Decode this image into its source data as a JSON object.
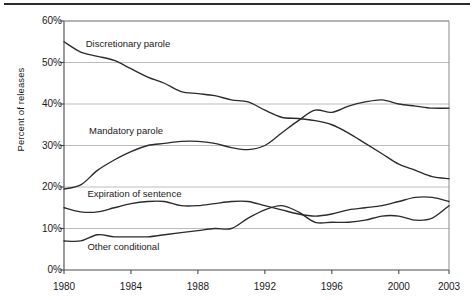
{
  "figure": {
    "has_top_rule": true,
    "background_color": "#ffffff",
    "line_color": "#2b2b2b",
    "grid_color": "#b4b4b4",
    "axis_color": "#555555"
  },
  "axes": {
    "y_axis_title": "Percent of releases",
    "y_ticks": [
      "0%",
      "10%",
      "20%",
      "30%",
      "40%",
      "50%",
      "60%"
    ],
    "y_tick_values": [
      0,
      10,
      20,
      30,
      40,
      50,
      60
    ],
    "x_ticks": [
      "1980",
      "1984",
      "1988",
      "1992",
      "1996",
      "2000",
      "2003"
    ],
    "x_tick_values": [
      1980,
      1984,
      1988,
      1992,
      1996,
      2000,
      2003
    ]
  },
  "series_labels": {
    "discretionary": "Discretionary parole",
    "mandatory": "Mandatory parole",
    "expiration": "Expiration of sentence",
    "other": "Other conditional"
  },
  "chart_data": {
    "type": "line",
    "title": "",
    "subtitle": "",
    "xlabel": "",
    "ylabel": "Percent of releases",
    "xlim": [
      1980,
      2003
    ],
    "ylim": [
      0,
      60
    ],
    "grid": true,
    "grid_axis": "y",
    "legend": "inline-labels",
    "x": [
      1980,
      1981,
      1982,
      1983,
      1984,
      1985,
      1986,
      1987,
      1988,
      1989,
      1990,
      1991,
      1992,
      1993,
      1994,
      1995,
      1996,
      1997,
      1998,
      1999,
      2000,
      2001,
      2002,
      2003
    ],
    "series": [
      {
        "name": "Discretionary parole",
        "label_position": {
          "x": 1981.3,
          "y": 54.5
        },
        "values": [
          55.0,
          52.5,
          51.5,
          50.5,
          48.5,
          46.5,
          45.0,
          43.0,
          42.5,
          42.0,
          41.0,
          40.5,
          38.5,
          36.8,
          36.5,
          36.0,
          35.0,
          33.0,
          30.5,
          28.0,
          25.5,
          24.0,
          22.5,
          22.0
        ]
      },
      {
        "name": "Mandatory parole",
        "label_position": {
          "x": 1981.5,
          "y": 33.5
        },
        "values": [
          19.5,
          20.5,
          24.0,
          26.5,
          28.5,
          30.0,
          30.5,
          31.0,
          31.0,
          30.5,
          29.5,
          29.0,
          30.0,
          33.0,
          36.0,
          38.5,
          38.0,
          39.5,
          40.5,
          41.0,
          40.0,
          39.5,
          39.0,
          39.0
        ]
      },
      {
        "name": "Expiration of sentence",
        "label_position": {
          "x": 1981.4,
          "y": 18.3
        },
        "values": [
          15.0,
          14.0,
          14.0,
          15.0,
          16.0,
          16.5,
          16.5,
          15.5,
          15.5,
          16.0,
          16.5,
          16.5,
          15.5,
          14.5,
          13.5,
          13.0,
          13.5,
          14.5,
          15.0,
          15.5,
          16.5,
          17.5,
          17.5,
          16.5
        ]
      },
      {
        "name": "Other conditional",
        "label_position": {
          "x": 1981.4,
          "y": 5.6
        },
        "values": [
          7.0,
          7.0,
          8.5,
          8.0,
          8.0,
          8.0,
          8.5,
          9.0,
          9.5,
          10.0,
          10.0,
          12.5,
          14.5,
          15.5,
          14.0,
          11.5,
          11.5,
          11.5,
          12.0,
          13.0,
          13.0,
          12.0,
          12.5,
          15.5
        ]
      }
    ]
  }
}
